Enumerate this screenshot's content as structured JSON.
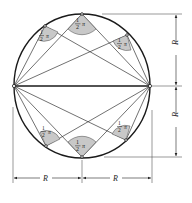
{
  "figure": {
    "circle": {
      "cx": 82,
      "cy": 86,
      "rx": 68,
      "ry": 72,
      "stroke": "#1a1a1a"
    },
    "diameter": {
      "x1": 14,
      "y1": 86,
      "x2": 150,
      "y2": 86
    },
    "endpoints": [
      {
        "x": 14,
        "y": 86
      },
      {
        "x": 150,
        "y": 86
      }
    ],
    "arc_points": [
      {
        "id": "top",
        "x": 82,
        "y": 14
      },
      {
        "id": "upper-left",
        "x": 45,
        "y": 26
      },
      {
        "id": "upper-right",
        "x": 127,
        "y": 35
      },
      {
        "id": "bottom",
        "x": 82,
        "y": 157
      },
      {
        "id": "lower-left",
        "x": 46,
        "y": 146
      },
      {
        "id": "lower-right",
        "x": 126,
        "y": 140
      }
    ],
    "angle_label": {
      "numerator": "1",
      "denominator": "2",
      "symbol": "π"
    },
    "wedge_fill": "#c8c8c8",
    "dimensions": {
      "vertical_upper": {
        "label": "R",
        "x": 176,
        "y1": 14,
        "y2": 86
      },
      "vertical_lower": {
        "label": "R",
        "x": 176,
        "y1": 86,
        "y2": 157
      },
      "horizontal_left": {
        "label": "R",
        "y": 178,
        "x1": 13,
        "x2": 82
      },
      "horizontal_right": {
        "label": "R",
        "y": 178,
        "x1": 82,
        "x2": 152
      }
    }
  }
}
